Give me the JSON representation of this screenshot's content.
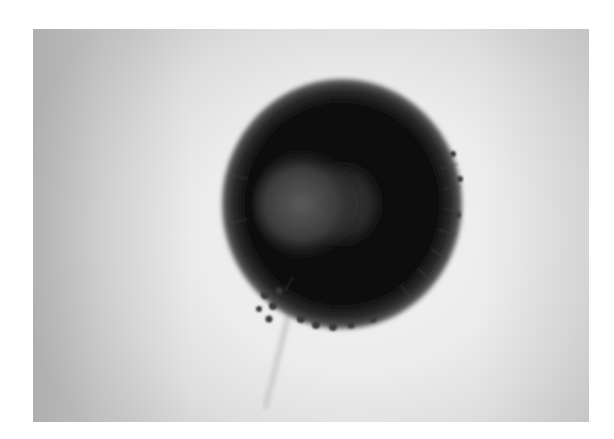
{
  "image": {
    "subject": "fungal conidial head micrograph",
    "colors": {
      "background_light": "#efefef",
      "background_edge": "#b8b8b8",
      "head_dark": "#0a0a0a",
      "head_mid": "#2e2e2e",
      "center_gray": "#4a4a4a"
    }
  }
}
